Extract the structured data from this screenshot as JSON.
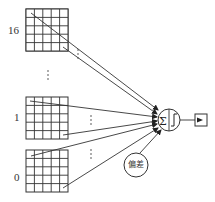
{
  "diagram": {
    "type": "perceptron",
    "inputs": [
      {
        "label": "16",
        "grid": {
          "x": 26,
          "y": 9,
          "size": 42,
          "cells": 5
        }
      },
      {
        "label": "1",
        "grid": {
          "x": 26,
          "y": 97,
          "size": 42,
          "cells": 5
        }
      },
      {
        "label": "0",
        "grid": {
          "x": 26,
          "y": 150,
          "size": 42,
          "cells": 5
        }
      }
    ],
    "ellipsis": "⋮",
    "neuron": {
      "symbol_sum": "Σ",
      "symbol_step": "step",
      "cx": 169,
      "cy": 120,
      "r": 11
    },
    "bias": {
      "label": "偏差"
    },
    "output": {
      "type": "square-box"
    },
    "colors": {
      "line": "#333333",
      "background": "#ffffff"
    }
  }
}
